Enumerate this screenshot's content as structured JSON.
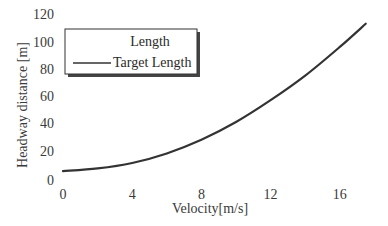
{
  "chart_data": {
    "type": "line",
    "title": "",
    "xlabel": "Velocity[m/s]",
    "ylabel": "Headway distance [m]",
    "xlim": [
      0,
      17.5
    ],
    "ylim": [
      0,
      120
    ],
    "xticks": [
      0,
      4,
      8,
      12,
      16
    ],
    "yticks": [
      0,
      20,
      40,
      60,
      80,
      100,
      120
    ],
    "grid": false,
    "legend": {
      "position": "upper-left",
      "entries": [
        {
          "label": "Length",
          "line": false
        },
        {
          "label": "Target Length",
          "line": true
        }
      ]
    },
    "series": [
      {
        "name": "Target Length",
        "color": "#333333",
        "x": [
          0,
          2,
          4,
          6,
          8,
          10,
          12,
          14,
          16,
          17.5
        ],
        "y": [
          5,
          7,
          11,
          18,
          28,
          41,
          57,
          75,
          96,
          113
        ]
      }
    ]
  },
  "legend": {
    "title": "Length",
    "entry": "Target Length"
  },
  "axes": {
    "xlabel": "Velocity[m/s]",
    "ylabel": "Headway distance [m]"
  }
}
